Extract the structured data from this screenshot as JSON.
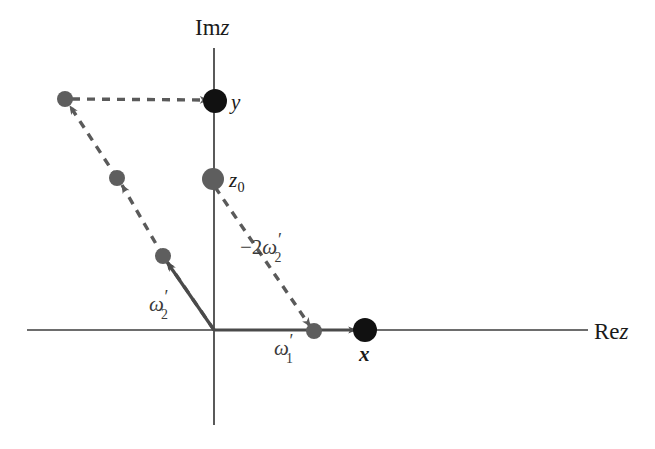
{
  "figure": {
    "background_color": "#ffffff",
    "axes": {
      "imaginary_label": "Im",
      "imaginary_label_var": "z",
      "real_label": "Re",
      "real_label_var": "z",
      "axis_color": "#3d3d3d",
      "origin": {
        "x": 214,
        "y": 330
      },
      "vertical_axis": {
        "x": 214,
        "y_top": 48,
        "y_bottom": 425
      },
      "horizontal_axis": {
        "y": 330,
        "x_left": 27,
        "x_right": 588
      }
    },
    "colors": {
      "black_point": "#111111",
      "gray_point": "#5e5e5e",
      "solid_vector": "#4a4a4a",
      "dashed_vector": "#5a5a5a",
      "label_text": "#1a1a1a"
    },
    "points": [
      {
        "id": "y",
        "label": "y",
        "style": "black",
        "x": 215,
        "y": 101,
        "r": 12,
        "label_x": 231,
        "label_y": 92
      },
      {
        "id": "x",
        "label": "x",
        "style": "black-bold",
        "x": 365,
        "y": 330,
        "r": 12,
        "label_x": 359,
        "label_y": 344
      },
      {
        "id": "z0",
        "label": "z",
        "label_sub": "0",
        "style": "gray",
        "x": 213,
        "y": 179,
        "r": 11,
        "label_x": 229,
        "label_y": 170
      },
      {
        "id": "w1",
        "label": "ω",
        "label_prime": "′",
        "label_sub": "1",
        "style": "gray",
        "x": 314,
        "y": 331,
        "r": 8,
        "label_x": 274,
        "label_y": 338
      },
      {
        "id": "w2",
        "label": "ω",
        "label_prime": "′",
        "label_sub": "2",
        "style": "gray",
        "x": 163,
        "y": 256,
        "r": 8,
        "label_x": 149,
        "label_y": 294
      },
      {
        "id": "node-mid",
        "label": "",
        "style": "gray",
        "x": 117,
        "y": 178,
        "r": 8
      },
      {
        "id": "node-upper",
        "label": "",
        "style": "gray",
        "x": 65,
        "y": 99,
        "r": 8
      }
    ],
    "vectors": [
      {
        "id": "omega1-vector",
        "style": "solid",
        "from": {
          "x": 214,
          "y": 330
        },
        "to": {
          "x": 365,
          "y": 330
        }
      },
      {
        "id": "omega2-vector",
        "style": "solid",
        "from": {
          "x": 214,
          "y": 330
        },
        "to": {
          "x": 163,
          "y": 256
        }
      },
      {
        "id": "translate-1",
        "style": "dashed",
        "from": {
          "x": 214,
          "y": 330
        },
        "to": {
          "x": 163,
          "y": 256
        }
      },
      {
        "id": "translate-2",
        "style": "dashed",
        "from": {
          "x": 163,
          "y": 256
        },
        "to": {
          "x": 117,
          "y": 178
        }
      },
      {
        "id": "translate-3",
        "style": "dashed",
        "from": {
          "x": 117,
          "y": 178
        },
        "to": {
          "x": 65,
          "y": 99
        }
      },
      {
        "id": "translate-to-y",
        "style": "dashed",
        "from": {
          "x": 65,
          "y": 99
        },
        "to": {
          "x": 215,
          "y": 101
        }
      },
      {
        "id": "minus-two-omega2",
        "style": "dashed",
        "from": {
          "x": 213,
          "y": 179
        },
        "to": {
          "x": 314,
          "y": 331
        }
      }
    ],
    "annotations": [
      {
        "id": "minus-2-omega2-label",
        "prefix": "−2",
        "symbol": "ω",
        "prime": "′",
        "sub": "2",
        "x": 240,
        "y": 237
      }
    ]
  }
}
